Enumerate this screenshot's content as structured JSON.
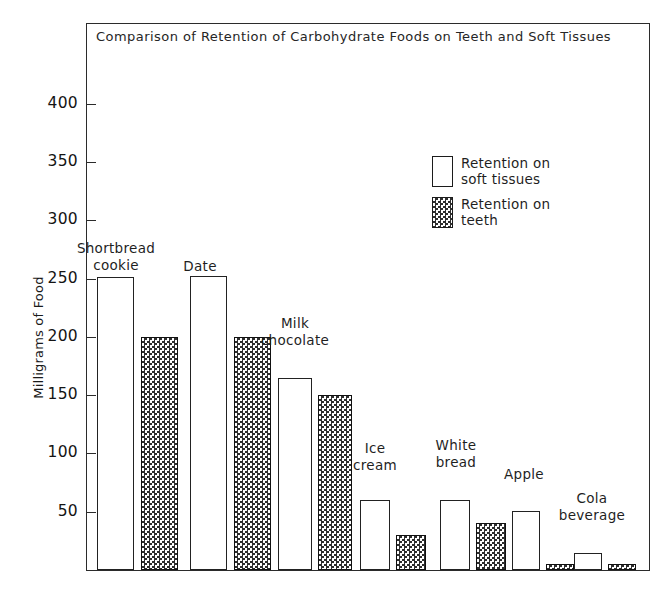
{
  "chart_data": {
    "type": "bar",
    "title": "Comparison of Retention of Carbohydrate  Foods on Teeth and Soft Tissues",
    "xlabel": "",
    "ylabel": "Milligrams of Food",
    "ylim": [
      0,
      440
    ],
    "yticks": [
      50,
      100,
      150,
      200,
      250,
      300,
      350,
      400
    ],
    "ytick_labels": [
      "50",
      "100",
      "150",
      "200",
      "250",
      "300",
      "350",
      "400"
    ],
    "grid": false,
    "legend_position": "upper right",
    "categories": [
      "Shortbread\ncookie",
      "Date",
      "Milk\nchocolate",
      "Ice\ncream",
      "White\nbread",
      "Apple",
      "Cola\nbeverage"
    ],
    "series": [
      {
        "name": "Retention on\nsoft tissues",
        "fill": "open",
        "values": [
          251,
          252,
          165,
          60,
          60,
          51,
          15
        ]
      },
      {
        "name": "Retention on\nteeth",
        "fill": "checkered",
        "values": [
          200,
          200,
          150,
          30,
          40,
          5,
          5
        ]
      }
    ]
  },
  "legend": {
    "items": [
      {
        "label": "Retention on\nsoft tissues",
        "swatch": "open-rectangle-swatch"
      },
      {
        "label": "Retention on\nteeth",
        "swatch": "checkered-rectangle-swatch"
      }
    ]
  },
  "colors": {
    "axis": "#2b2b2b",
    "bar_outline": "#222222",
    "hatch": "#2e2e2e",
    "background": "#ffffff",
    "text": "#1a1a1a"
  }
}
